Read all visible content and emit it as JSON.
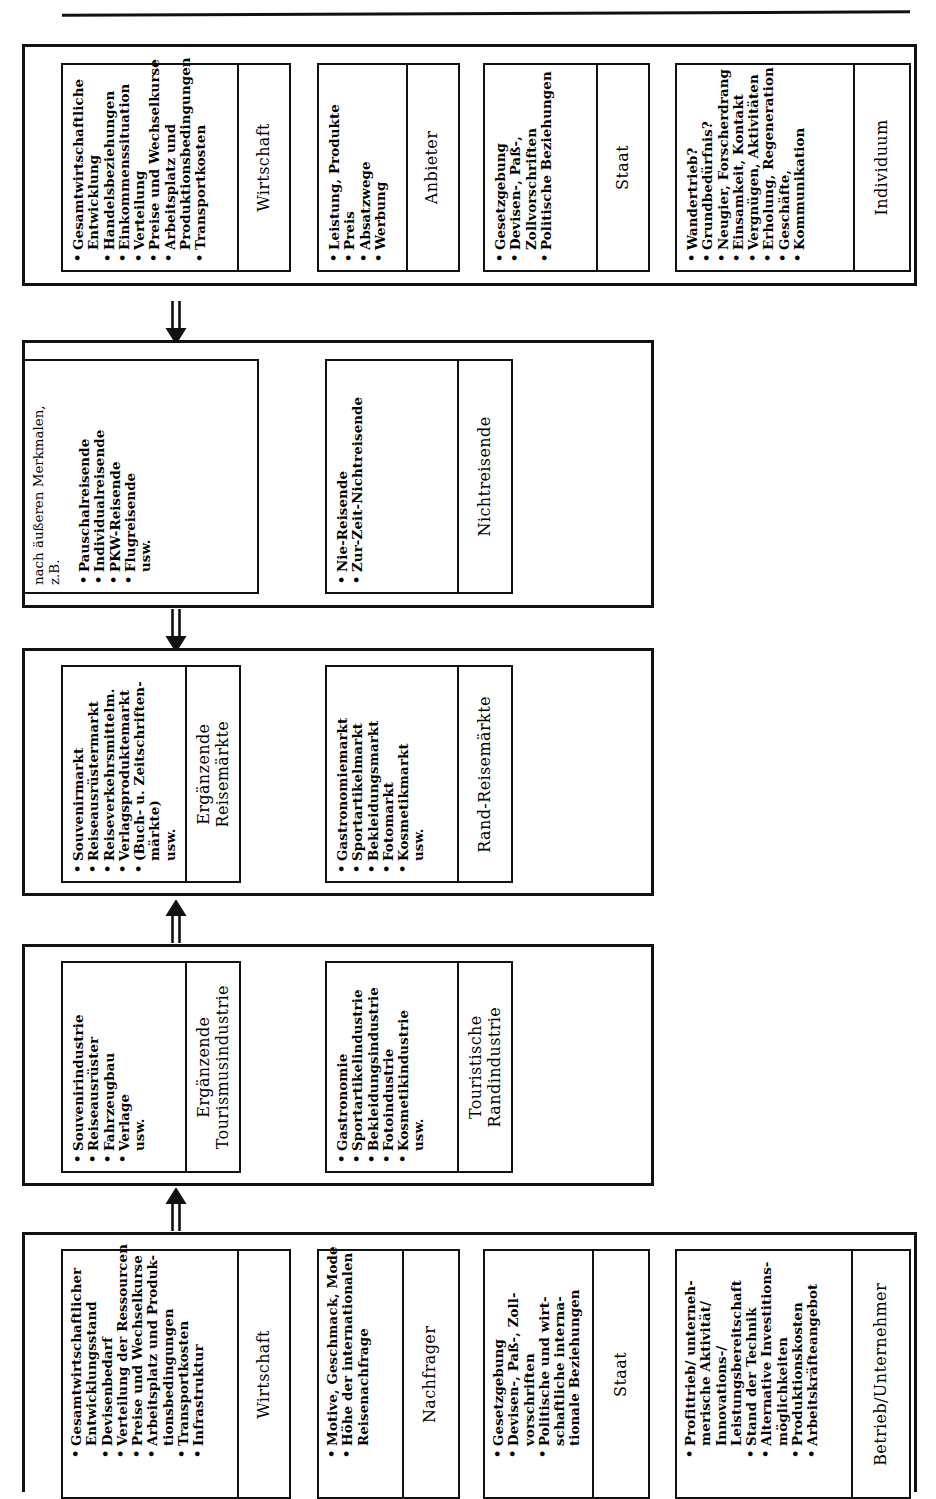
{
  "diagram": {
    "orientation": "rotated-90-ccw",
    "title_rule": true,
    "bands": [
      {
        "id": "band-1",
        "name": "einflussfaktoren-reisemarkt",
        "boxes": [
          {
            "title": "Wirtschaft",
            "items": [
              {
                "bullet": true,
                "text": "Gesamtwirtschaftliche"
              },
              {
                "bullet": false,
                "text": "Entwicklung"
              },
              {
                "bullet": true,
                "text": "Handelsbeziehungen"
              },
              {
                "bullet": true,
                "text": "Einkommenssituation"
              },
              {
                "bullet": true,
                "text": "Verteilung"
              },
              {
                "bullet": true,
                "text": "Preise und Wechselkurse"
              },
              {
                "bullet": true,
                "text": "Arbeitsplatz und"
              },
              {
                "bullet": false,
                "text": "Produktionsbedingungen"
              },
              {
                "bullet": true,
                "text": "Transportkosten"
              }
            ]
          },
          {
            "title": "Anbieter",
            "items": [
              {
                "bullet": true,
                "text": "Leistung, Produkte"
              },
              {
                "bullet": true,
                "text": "Preis"
              },
              {
                "bullet": true,
                "text": "Absatzwege"
              },
              {
                "bullet": true,
                "text": "Werbung"
              }
            ]
          },
          {
            "title": "Staat",
            "items": [
              {
                "bullet": true,
                "text": "Gesetzgebung"
              },
              {
                "bullet": true,
                "text": "Devisen-, Paß-,"
              },
              {
                "bullet": false,
                "text": "Zollvorschriften"
              },
              {
                "bullet": true,
                "text": "Politische Beziehungen"
              }
            ]
          },
          {
            "title": "Individuum",
            "items": [
              {
                "bullet": true,
                "text": "Wandertrieb?"
              },
              {
                "bullet": true,
                "text": "Grundbedürfnis?"
              },
              {
                "bullet": true,
                "text": "Neugier, Forscherdrang"
              },
              {
                "bullet": true,
                "text": "Einsamkeit, Kontakt"
              },
              {
                "bullet": true,
                "text": "Vergnügen, Aktivitäten"
              },
              {
                "bullet": true,
                "text": "Erholung, Regeneration"
              },
              {
                "bullet": true,
                "text": "Geschäfte,"
              },
              {
                "bullet": true,
                "text": "Kommunikation"
              }
            ]
          }
        ]
      },
      {
        "id": "band-2",
        "name": "reisende-nichtreisende",
        "boxes": [
          {
            "lead": "nach äußeren Merkmalen,",
            "lead2": "z.B.",
            "items": [
              {
                "bullet": true,
                "text": "Pauschalreisende"
              },
              {
                "bullet": true,
                "text": "Individualreisende"
              },
              {
                "bullet": true,
                "text": "PKW-Reisende"
              },
              {
                "bullet": true,
                "text": "Flugreisende"
              },
              {
                "bullet": false,
                "text": "usw."
              }
            ]
          },
          {
            "title": "Nichtreisende",
            "items": [
              {
                "bullet": true,
                "text": "Nie-Reisende"
              },
              {
                "bullet": true,
                "text": "Zur-Zeit-Nichtreisende"
              }
            ]
          }
        ]
      },
      {
        "id": "band-3",
        "name": "ergaenzende-und-rand-reisemaerkte",
        "boxes": [
          {
            "title": "Ergänzende",
            "title2": "Reisemärkte",
            "items": [
              {
                "bullet": true,
                "text": "Souvenirmarkt"
              },
              {
                "bullet": true,
                "text": "Reiseausrüstermarkt"
              },
              {
                "bullet": true,
                "text": "Reiseverkehrsmittelm."
              },
              {
                "bullet": true,
                "text": "Verlagsproduktemarkt"
              },
              {
                "bullet": true,
                "text": "(Buch- u. Zeitschriften-"
              },
              {
                "bullet": false,
                "text": "märkte)"
              },
              {
                "bullet": false,
                "text": "usw."
              }
            ]
          },
          {
            "title": "Rand-Reisemärkte",
            "items": [
              {
                "bullet": true,
                "text": "Gastronomiemarkt"
              },
              {
                "bullet": true,
                "text": "Sportartikelmarkt"
              },
              {
                "bullet": true,
                "text": "Bekleidungsmarkt"
              },
              {
                "bullet": true,
                "text": "Fotomarkt"
              },
              {
                "bullet": true,
                "text": "Kosmetikmarkt"
              },
              {
                "bullet": false,
                "text": "usw."
              }
            ]
          }
        ]
      },
      {
        "id": "band-4",
        "name": "ergaenzende-tourismusindustrie",
        "boxes": [
          {
            "title": "Ergänzende",
            "title2": "Tourismusindustrie",
            "items": [
              {
                "bullet": true,
                "text": "Souvenirindustrie"
              },
              {
                "bullet": true,
                "text": "Reiseausrüster"
              },
              {
                "bullet": true,
                "text": "Fahrzeugbau"
              },
              {
                "bullet": true,
                "text": "Verlage"
              },
              {
                "bullet": false,
                "text": "usw."
              }
            ]
          },
          {
            "title": "Touristische",
            "title2": "Randindustrie",
            "items": [
              {
                "bullet": true,
                "text": "Gastronomie"
              },
              {
                "bullet": true,
                "text": "Sportartikelindustrie"
              },
              {
                "bullet": true,
                "text": "Bekleidungsindustrie"
              },
              {
                "bullet": true,
                "text": "Fotoindustrie"
              },
              {
                "bullet": true,
                "text": "Kosmetikindustrie"
              },
              {
                "bullet": false,
                "text": "usw."
              }
            ]
          }
        ]
      },
      {
        "id": "band-5",
        "name": "einflussfaktoren-produktion",
        "boxes": [
          {
            "title": "Wirtschaft",
            "items": [
              {
                "bullet": true,
                "text": "Gesamtwirtschaftlicher"
              },
              {
                "bullet": false,
                "text": "Entwicklungsstand"
              },
              {
                "bullet": true,
                "text": "Devisenbedarf"
              },
              {
                "bullet": true,
                "text": "Verteilung der Ressourcen"
              },
              {
                "bullet": true,
                "text": "Preise und Wechselkurse"
              },
              {
                "bullet": true,
                "text": "Arbeitsplatz und Produk-"
              },
              {
                "bullet": false,
                "text": "tionsbedingungen"
              },
              {
                "bullet": true,
                "text": "Transportkosten"
              },
              {
                "bullet": true,
                "text": "Infrastruktur"
              }
            ]
          },
          {
            "title": "Nachfrager",
            "items": [
              {
                "bullet": true,
                "text": "Motive, Geschmack, Mode"
              },
              {
                "bullet": true,
                "text": "Höhe der internationalen"
              },
              {
                "bullet": false,
                "text": "Reisenachfrage"
              }
            ]
          },
          {
            "title": "Staat",
            "items": [
              {
                "bullet": true,
                "text": "Gesetzgebung"
              },
              {
                "bullet": true,
                "text": "Devisen-, Paß-, Zoll-"
              },
              {
                "bullet": false,
                "text": "vorschriften"
              },
              {
                "bullet": true,
                "text": "Politische und wirt-"
              },
              {
                "bullet": false,
                "text": "schaftliche interna-"
              },
              {
                "bullet": false,
                "text": "tionale Beziehungen"
              }
            ]
          },
          {
            "title": "Betrieb/Unternehmer",
            "items": [
              {
                "bullet": true,
                "text": "Profittrieb/ unterneh-"
              },
              {
                "bullet": false,
                "text": "merische Aktivität/"
              },
              {
                "bullet": false,
                "text": "Innovations-/"
              },
              {
                "bullet": false,
                "text": "Leistungsbereitschaft"
              },
              {
                "bullet": true,
                "text": "Stand der Technik"
              },
              {
                "bullet": true,
                "text": "Alternative Investitions-"
              },
              {
                "bullet": false,
                "text": "möglichkeiten"
              },
              {
                "bullet": true,
                "text": "Produktionskosten"
              },
              {
                "bullet": true,
                "text": "Arbeitskräfteangebot"
              }
            ]
          }
        ]
      }
    ],
    "arrows": [
      {
        "name": "arrow-down-1",
        "direction": "down"
      },
      {
        "name": "arrow-down-2",
        "direction": "down"
      },
      {
        "name": "arrow-up-1",
        "direction": "up"
      },
      {
        "name": "arrow-up-2",
        "direction": "up"
      }
    ]
  }
}
